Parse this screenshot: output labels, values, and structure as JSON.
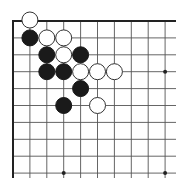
{
  "diagram": {
    "type": "go-board-corner",
    "grid": {
      "origin_x": 13,
      "origin_y": 21,
      "spacing": 16.9,
      "cols": 10,
      "rows": 10,
      "extend_right": 176,
      "extend_bottom": 178
    },
    "colors": {
      "background": "#ffffff",
      "line": "#555555",
      "edge": "#222222",
      "black_stone": "#1a1a1a",
      "white_stone_fill": "#ffffff",
      "white_stone_stroke": "#333333"
    },
    "star_points": [
      {
        "col": 9,
        "row": 3
      },
      {
        "col": 3,
        "row": 9
      },
      {
        "col": 9,
        "row": 9
      }
    ],
    "stones": [
      {
        "color": "white",
        "col": 1,
        "row": 0
      },
      {
        "color": "black",
        "col": 1,
        "row": 1
      },
      {
        "color": "white",
        "col": 2,
        "row": 1
      },
      {
        "color": "white",
        "col": 3,
        "row": 1
      },
      {
        "color": "black",
        "col": 2,
        "row": 2
      },
      {
        "color": "white",
        "col": 3,
        "row": 2
      },
      {
        "color": "black",
        "col": 4,
        "row": 2
      },
      {
        "color": "black",
        "col": 2,
        "row": 3
      },
      {
        "color": "black",
        "col": 3,
        "row": 3
      },
      {
        "color": "white",
        "col": 4,
        "row": 3
      },
      {
        "color": "white",
        "col": 5,
        "row": 3
      },
      {
        "color": "white",
        "col": 6,
        "row": 3
      },
      {
        "color": "black",
        "col": 4,
        "row": 4
      },
      {
        "color": "black",
        "col": 3,
        "row": 5
      },
      {
        "color": "white",
        "col": 5,
        "row": 5
      }
    ]
  }
}
